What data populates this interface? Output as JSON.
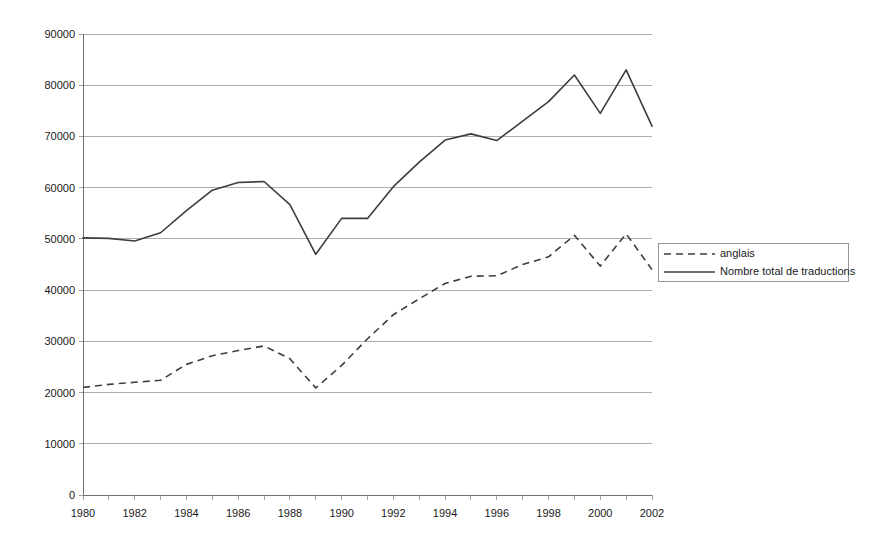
{
  "chart_data": {
    "type": "line",
    "title": "",
    "subtitle": "",
    "xlabel": "",
    "ylabel": "",
    "xlim": [
      1980,
      2002
    ],
    "ylim": [
      0,
      90000
    ],
    "grid": true,
    "legend_position": "right",
    "x": [
      1980,
      1981,
      1982,
      1983,
      1984,
      1985,
      1986,
      1987,
      1988,
      1989,
      1990,
      1991,
      1992,
      1993,
      1994,
      1995,
      1996,
      1997,
      1998,
      1999,
      2000,
      2001,
      2002
    ],
    "x_tick_labels": [
      "1980",
      "1982",
      "1984",
      "1986",
      "1988",
      "1990",
      "1992",
      "1994",
      "1996",
      "1998",
      "2000",
      "2002"
    ],
    "x_tick_values": [
      1980,
      1982,
      1984,
      1986,
      1988,
      1990,
      1992,
      1994,
      1996,
      1998,
      2000,
      2002
    ],
    "y_tick_labels": [
      "0",
      "10000",
      "20000",
      "30000",
      "40000",
      "50000",
      "60000",
      "70000",
      "80000",
      "90000"
    ],
    "y_tick_values": [
      0,
      10000,
      20000,
      30000,
      40000,
      50000,
      60000,
      70000,
      80000,
      90000
    ],
    "series": [
      {
        "name": "anglais",
        "style": "dashed",
        "color": "#3d3d3d",
        "values": [
          21000,
          21600,
          22000,
          22400,
          25500,
          27200,
          28200,
          29100,
          26600,
          20900,
          25300,
          30500,
          35200,
          38300,
          41300,
          42700,
          42800,
          45000,
          46500,
          50700,
          44700,
          51000,
          44000
        ]
      },
      {
        "name": "Nombre total de traductions",
        "style": "solid",
        "color": "#3d3d3d",
        "values": [
          50200,
          50100,
          49600,
          51200,
          55500,
          59500,
          61000,
          61200,
          56700,
          47000,
          54000,
          54000,
          60200,
          65000,
          69300,
          70500,
          69200,
          73000,
          76800,
          82000,
          74500,
          83000,
          72000
        ]
      }
    ]
  },
  "legend": {
    "entries": [
      {
        "label": "anglais",
        "style": "dashed"
      },
      {
        "label": "Nombre total de traductions",
        "style": "solid"
      }
    ]
  },
  "colors": {
    "series_stroke": "#3d3d3d",
    "gridline": "#9a9a9a",
    "axis": "#6f6f6f",
    "background": "#ffffff",
    "text": "#1a1a1a"
  }
}
